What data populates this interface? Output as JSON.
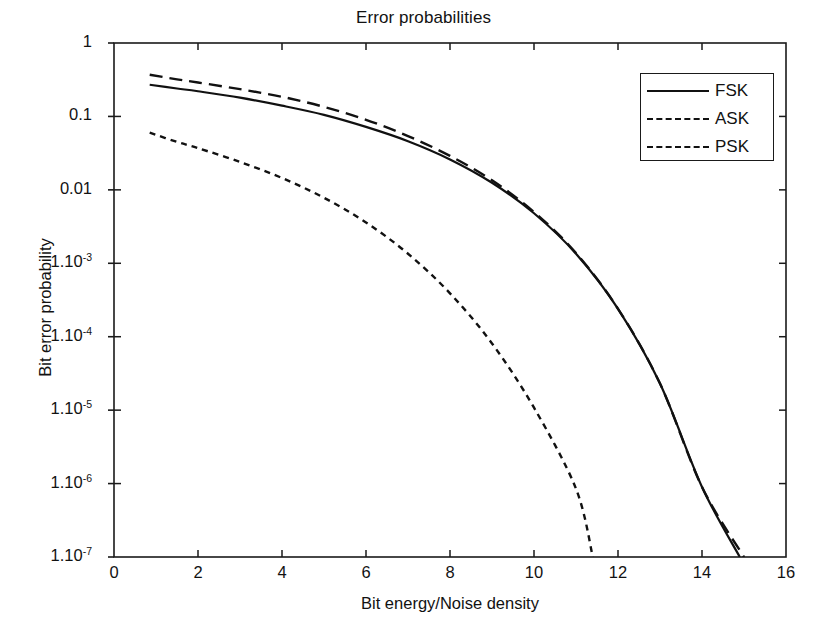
{
  "chart_data": {
    "type": "line",
    "title": "Error probabilities",
    "xlabel": "Bit energy/Noise density",
    "ylabel": "Bit error probability",
    "yscale": "log",
    "xlim": [
      0,
      16
    ],
    "ylim": [
      1e-07,
      1
    ],
    "grid": false,
    "legend_position": "top-right",
    "xticks": [
      0,
      2,
      4,
      6,
      8,
      10,
      12,
      14,
      16
    ],
    "xtick_labels": [
      "0",
      "2",
      "4",
      "6",
      "8",
      "10",
      "12",
      "14",
      "16"
    ],
    "yticks": [
      1,
      0.1,
      0.01,
      0.001,
      0.0001,
      1e-05,
      1e-06,
      1e-07
    ],
    "ytick_labels": [
      "1",
      "0.1",
      "0.01",
      "1.10",
      "1.10",
      "1.10",
      "1.10",
      "1.10"
    ],
    "ytick_exponents": [
      "",
      "",
      "",
      "-3",
      "-4",
      "-5",
      "-6",
      "-7"
    ],
    "series": [
      {
        "name": "FSK",
        "style": "solid",
        "color": "#111111",
        "x": [
          0.85,
          1.5,
          2,
          3,
          4,
          5,
          6,
          7,
          8,
          9,
          10,
          11,
          12,
          13,
          14,
          14.9
        ],
        "y": [
          0.27,
          0.24,
          0.22,
          0.18,
          0.14,
          0.105,
          0.072,
          0.046,
          0.026,
          0.0125,
          0.0048,
          0.00135,
          0.00024,
          2.3e-05,
          9e-07,
          1e-07
        ]
      },
      {
        "name": "ASK",
        "style": "dotted",
        "color": "#111111",
        "x": [
          0.85,
          1.5,
          2,
          3,
          4,
          5,
          6,
          7,
          8,
          9,
          10,
          11,
          11.4
        ],
        "y": [
          0.06,
          0.045,
          0.037,
          0.024,
          0.0145,
          0.0078,
          0.0036,
          0.00135,
          0.00039,
          8.1e-05,
          1.08e-05,
          8.5e-07,
          1e-07
        ]
      },
      {
        "name": "PSK",
        "style": "dashed",
        "color": "#111111",
        "x": [
          0.85,
          1.5,
          2,
          3,
          4,
          5,
          6,
          7,
          8,
          9,
          10,
          11,
          12,
          13,
          14,
          15.0
        ],
        "y": [
          0.37,
          0.32,
          0.29,
          0.235,
          0.185,
          0.135,
          0.09,
          0.054,
          0.029,
          0.0135,
          0.005,
          0.00138,
          0.00024,
          2.3e-05,
          9e-07,
          1e-07
        ]
      }
    ]
  },
  "legend": {
    "items": [
      {
        "label": "FSK",
        "style": "solid"
      },
      {
        "label": "ASK",
        "style": "dotted"
      },
      {
        "label": "PSK",
        "style": "dashed"
      }
    ]
  },
  "caption": {
    "text": ""
  }
}
